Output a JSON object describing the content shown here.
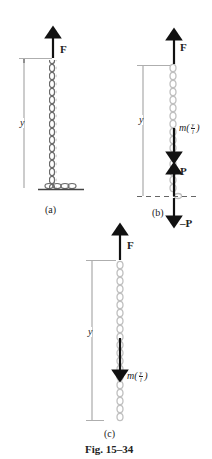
{
  "figure": {
    "caption": "Fig. 15–34",
    "panels": [
      {
        "id": "a",
        "label": "(a)",
        "force_top": "F",
        "dimension": "y"
      },
      {
        "id": "b",
        "label": "(b)",
        "force_top": "F",
        "dimension": "y",
        "momentum_label": {
          "prefix": "m(",
          "num": "y",
          "den": "l",
          "suffix": ")"
        },
        "force_up": "P",
        "force_down": "–P"
      },
      {
        "id": "c",
        "label": "(c)",
        "force_top": "F",
        "dimension": "y",
        "momentum_label": {
          "prefix": "m(",
          "num": "y",
          "den": "l",
          "suffix": ")"
        }
      }
    ]
  },
  "colors": {
    "chain_dark": "#6b6b6b",
    "chain_light": "#c8c8c8",
    "arrow": "#111111",
    "dim_line": "#555555",
    "ground": "#444444"
  }
}
